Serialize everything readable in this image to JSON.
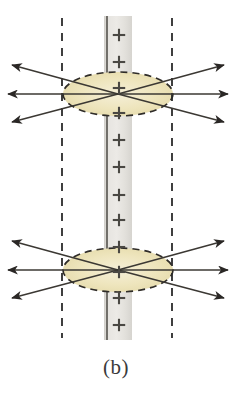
{
  "figure": {
    "caption": "(b)",
    "colors": {
      "sheet_fill_light": "#e8e6e2",
      "sheet_fill_dark": "#d2d0cb",
      "sheet_edge_line": "#55524d",
      "ellipse_fill": "#ece2b8",
      "ellipse_fill_center": "#f2ead0",
      "ellipse_dash_stroke": "#2f2c28",
      "guide_dash_stroke": "#2b2b2b",
      "arrow_stroke": "#3b3833",
      "arrow_head_fill": "#2a2725",
      "plus_sign": "#4a4843",
      "caption_text": "#3a3a3a",
      "background": "#ffffff"
    },
    "sheet": {
      "label": "charged-sheet",
      "x_left": 104,
      "x_right": 132,
      "y_top": 16,
      "y_bottom": 340,
      "edge_line_x": 107,
      "charge_symbol": "+",
      "charge_count": 12,
      "charge_y_positions": [
        35,
        62,
        88,
        113,
        140,
        167,
        195,
        220,
        247,
        272,
        298,
        325
      ]
    },
    "guide_lines": [
      {
        "label": "left-guide-line",
        "x": 62,
        "y_top": 18,
        "y_bottom": 338,
        "style": "dashed"
      },
      {
        "label": "right-guide-line",
        "x": 172,
        "y_top": 18,
        "y_bottom": 338,
        "style": "dashed"
      }
    ],
    "gaussian_surfaces": [
      {
        "label": "upper-gaussian-ellipse",
        "cx": 118,
        "cy": 94,
        "rx": 55,
        "ry": 22,
        "style": "dashed"
      },
      {
        "label": "lower-gaussian-ellipse",
        "cx": 118,
        "cy": 270,
        "rx": 55,
        "ry": 22,
        "style": "dashed"
      }
    ],
    "field_line_groups": [
      {
        "label": "upper-field-lines",
        "origin_x": 118,
        "origin_y": 94,
        "rays": [
          {
            "name": "upper-left-up",
            "tip_x": 12,
            "tip_y": 65
          },
          {
            "name": "upper-left-mid",
            "tip_x": 8,
            "tip_y": 94
          },
          {
            "name": "upper-left-down",
            "tip_x": 12,
            "tip_y": 122
          },
          {
            "name": "upper-right-up",
            "tip_x": 224,
            "tip_y": 65
          },
          {
            "name": "upper-right-mid",
            "tip_x": 228,
            "tip_y": 94
          },
          {
            "name": "upper-right-down",
            "tip_x": 224,
            "tip_y": 122
          }
        ]
      },
      {
        "label": "lower-field-lines",
        "origin_x": 118,
        "origin_y": 270,
        "rays": [
          {
            "name": "lower-left-up",
            "tip_x": 12,
            "tip_y": 241
          },
          {
            "name": "lower-left-mid",
            "tip_x": 8,
            "tip_y": 270
          },
          {
            "name": "lower-left-down",
            "tip_x": 12,
            "tip_y": 298
          },
          {
            "name": "lower-right-up",
            "tip_x": 224,
            "tip_y": 241
          },
          {
            "name": "lower-right-mid",
            "tip_x": 228,
            "tip_y": 270
          },
          {
            "name": "lower-right-down",
            "tip_x": 224,
            "tip_y": 298
          }
        ]
      }
    ]
  }
}
